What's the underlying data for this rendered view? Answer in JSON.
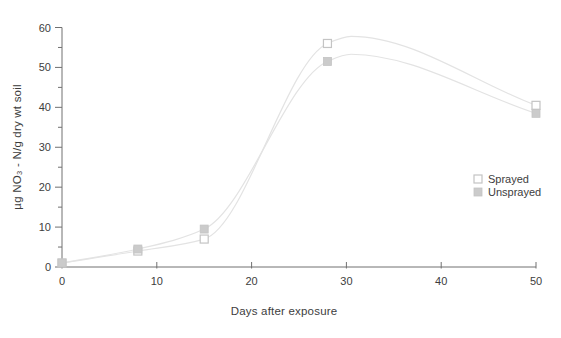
{
  "chart_data": {
    "type": "line",
    "title": "",
    "xlabel": "Days after exposure",
    "ylabel": "µg NO₃ - N/g dry wt soil",
    "xlim": [
      0,
      50
    ],
    "ylim": [
      0,
      60
    ],
    "x_ticks": [
      0,
      10,
      20,
      30,
      40,
      50
    ],
    "y_ticks_major": [
      0,
      10,
      20,
      30,
      40,
      50,
      60
    ],
    "y_ticks_minor": [
      5,
      15,
      25,
      35,
      45,
      55
    ],
    "grid": false,
    "legend_position": "middle-right",
    "series": [
      {
        "name": "Sprayed",
        "marker": "open-square",
        "x": [
          0,
          8,
          15,
          28,
          50
        ],
        "y": [
          1,
          4,
          7,
          56,
          40.5
        ]
      },
      {
        "name": "Unsprayed",
        "marker": "filled-square",
        "x": [
          0,
          8,
          15,
          28,
          50
        ],
        "y": [
          1,
          4.5,
          9.5,
          51.5,
          38.5
        ]
      }
    ],
    "colors": {
      "line": "#e3e3e3",
      "marker_fill": "#cbcbcb",
      "marker_stroke": "#c4c4c4",
      "open_marker_fill": "#ffffff",
      "axis": "#707070",
      "text": "#3d3d3d",
      "background": "#ffffff"
    }
  }
}
